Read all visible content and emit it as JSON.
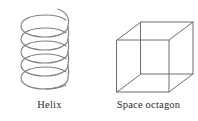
{
  "page": {
    "width": 198,
    "height": 121,
    "background_color": "#ffffff",
    "stroke_color": "#808080",
    "cube_stroke_color": "#6e6e6e",
    "text_color": "#2b2b2b"
  },
  "figures": [
    {
      "id": "helix",
      "caption": "Helix",
      "icon_name": "helix-curve",
      "type": "helix",
      "turns": 5.5,
      "coil_count": 6,
      "center_x": 46,
      "radius_x": 26,
      "radius_y": 7.5,
      "top_y": 12,
      "bottom_y": 90,
      "has_top_tail": true,
      "has_bottom_tail": true
    },
    {
      "id": "space-octagon",
      "caption": "Space octagon",
      "icon_name": "wireframe-cube",
      "type": "cube",
      "projection": "oblique",
      "edges": 12,
      "vertices": 8,
      "hidden_lines_shown": true,
      "front_face": {
        "left": 18,
        "top": 40,
        "size": 52
      },
      "depth_offset": {
        "dx": 24,
        "dy": -18
      }
    }
  ]
}
